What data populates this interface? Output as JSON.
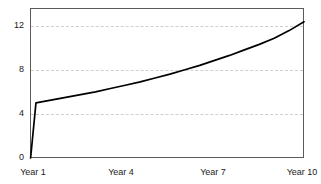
{
  "chart_data": {
    "type": "line",
    "title": "",
    "subtitle": "",
    "xlabel": "",
    "ylabel": "",
    "xlim": [
      0.8,
      10.0
    ],
    "ylim": [
      0,
      13.6
    ],
    "grid": true,
    "grid_axis": "y",
    "legend": null,
    "legend_position": "none",
    "line_color": "#000000",
    "frame_color": "#5a5a5a",
    "grid_color": "#cfcfcf",
    "y_ticks": [
      0,
      4,
      8,
      12
    ],
    "y_tick_labels": [
      "0",
      "4",
      "8",
      "12"
    ],
    "x_ticks": [
      1,
      4,
      7,
      10
    ],
    "x_tick_labels": [
      "Year 1",
      "Year 4",
      "Year 7",
      "Year 10"
    ],
    "x": [
      0.82,
      1.0,
      1.5,
      2.0,
      2.5,
      3.0,
      3.5,
      4.0,
      4.5,
      5.0,
      5.5,
      6.0,
      6.5,
      7.0,
      7.5,
      8.0,
      8.5,
      9.0,
      9.5,
      10.0
    ],
    "values": [
      0.0,
      5.0,
      5.25,
      5.5,
      5.75,
      6.0,
      6.3,
      6.6,
      6.9,
      7.25,
      7.6,
      8.0,
      8.4,
      8.85,
      9.3,
      9.8,
      10.3,
      10.85,
      11.55,
      12.35
    ],
    "series": [
      {
        "name": "value",
        "values": [
          0.0,
          5.0,
          5.25,
          5.5,
          5.75,
          6.0,
          6.3,
          6.6,
          6.9,
          7.25,
          7.6,
          8.0,
          8.4,
          8.85,
          9.3,
          9.8,
          10.3,
          10.85,
          11.55,
          12.35
        ]
      }
    ],
    "annotations": []
  }
}
